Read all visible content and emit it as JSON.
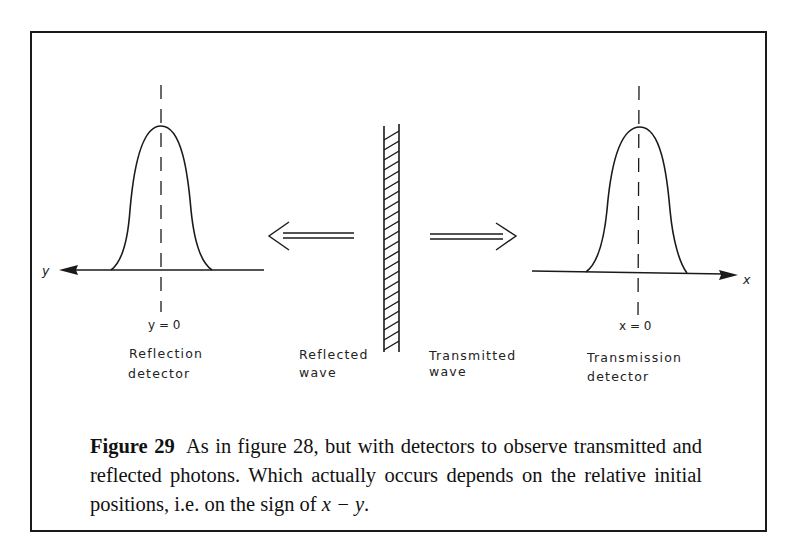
{
  "figure": {
    "number_label": "Figure 29",
    "caption_text": "As in figure 28, but with detectors to observe transmitted and reflected photons. Which actually occurs depends on the relative initial positions, i.e. on the sign of ",
    "caption_math": "x − y",
    "caption_end": "."
  },
  "diagram": {
    "left_axis_label": "y",
    "right_axis_label": "x",
    "left_origin_label": "y = 0",
    "right_origin_label": "x = 0",
    "left_detector_label_line1": "Reflection",
    "left_detector_label_line2": "detector",
    "right_detector_label_line1": "Transmission",
    "right_detector_label_line2": "detector",
    "reflected_wave_line1": "Reflected",
    "reflected_wave_line2": "wave",
    "transmitted_wave_line1": "Transmitted",
    "transmitted_wave_line2": "wave",
    "elements": [
      "reflection-detector-wavepacket",
      "mirror-barrier",
      "reflected-arrow",
      "transmitted-arrow",
      "transmission-detector-wavepacket"
    ],
    "line_color": "#1a1a1a"
  }
}
